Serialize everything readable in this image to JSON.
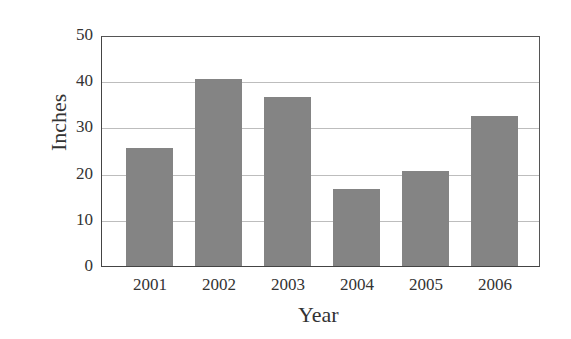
{
  "chart_data": {
    "type": "bar",
    "title": "",
    "xlabel": "Year",
    "ylabel": "Inches",
    "categories": [
      "2001",
      "2002",
      "2003",
      "2004",
      "2005",
      "2006"
    ],
    "values": [
      26,
      41,
      37,
      17,
      21,
      33
    ],
    "ylim": [
      0,
      50
    ],
    "yticks": [
      "0",
      "10",
      "20",
      "30",
      "40",
      "50"
    ],
    "grid": "horizontal",
    "legend": null,
    "colors": {
      "bar": "#848484",
      "grid": "#bdbdbd",
      "frame": "#444444"
    }
  }
}
